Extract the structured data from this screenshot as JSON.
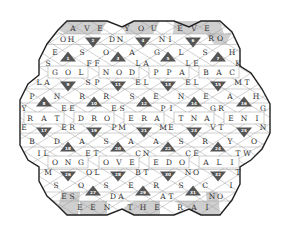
{
  "puzzle": {
    "type": "hexagonal-word-puzzle",
    "colors": {
      "background": "#ffffff",
      "outline": "#222222",
      "grid_line": "#9a9a9a",
      "dark_triangle": "#555555",
      "shaded_border": "#cfcfcf",
      "letter": "#333333",
      "number": "#ffffff"
    },
    "border_phrases": {
      "top": [
        "AVE",
        "YOU",
        "EVE"
      ],
      "bottom": [
        "EEN",
        "THE",
        "RAI"
      ]
    },
    "letters": [
      {
        "t": "A",
        "x": 73,
        "y": 28,
        "shade": true
      },
      {
        "t": "V",
        "x": 87,
        "y": 28,
        "shade": true
      },
      {
        "t": "E",
        "x": 100,
        "y": 28,
        "shade": true
      },
      {
        "t": "Y",
        "x": 127,
        "y": 28,
        "shade": true
      },
      {
        "t": "O",
        "x": 141,
        "y": 28,
        "shade": true
      },
      {
        "t": "U",
        "x": 154,
        "y": 28,
        "shade": true
      },
      {
        "t": "E",
        "x": 180,
        "y": 28,
        "shade": true
      },
      {
        "t": "V",
        "x": 194,
        "y": 28,
        "shade": true
      },
      {
        "t": "E",
        "x": 207,
        "y": 28,
        "shade": true
      },
      {
        "t": "O",
        "x": 63,
        "y": 39
      },
      {
        "t": "H",
        "x": 71,
        "y": 39
      },
      {
        "t": "D",
        "x": 112,
        "y": 39
      },
      {
        "t": "N",
        "x": 120,
        "y": 39
      },
      {
        "t": "N",
        "x": 162,
        "y": 39
      },
      {
        "t": "I",
        "x": 170,
        "y": 39
      },
      {
        "t": "R",
        "x": 211,
        "y": 38
      },
      {
        "t": "O",
        "x": 220,
        "y": 38
      },
      {
        "t": "E",
        "x": 55,
        "y": 52
      },
      {
        "t": "S",
        "x": 82,
        "y": 52
      },
      {
        "t": "O",
        "x": 106,
        "y": 52
      },
      {
        "t": "A",
        "x": 132,
        "y": 52
      },
      {
        "t": "G",
        "x": 157,
        "y": 52
      },
      {
        "t": "L",
        "x": 181,
        "y": 52
      },
      {
        "t": "S",
        "x": 205,
        "y": 52
      },
      {
        "t": "H",
        "x": 232,
        "y": 52
      },
      {
        "t": "S",
        "x": 48,
        "y": 63
      },
      {
        "t": "F",
        "x": 89,
        "y": 63
      },
      {
        "t": "F",
        "x": 97,
        "y": 63
      },
      {
        "t": "L",
        "x": 138,
        "y": 63
      },
      {
        "t": "A",
        "x": 146,
        "y": 63
      },
      {
        "t": "L",
        "x": 188,
        "y": 63
      },
      {
        "t": "E",
        "x": 196,
        "y": 63
      },
      {
        "t": "K",
        "x": 238,
        "y": 63
      },
      {
        "t": "G",
        "x": 55,
        "y": 72
      },
      {
        "t": "O",
        "x": 68,
        "y": 72
      },
      {
        "t": "L",
        "x": 81,
        "y": 72
      },
      {
        "t": "N",
        "x": 106,
        "y": 72
      },
      {
        "t": "O",
        "x": 119,
        "y": 72
      },
      {
        "t": "D",
        "x": 132,
        "y": 72
      },
      {
        "t": "P",
        "x": 156,
        "y": 72
      },
      {
        "t": "P",
        "x": 169,
        "y": 72
      },
      {
        "t": "A",
        "x": 182,
        "y": 72
      },
      {
        "t": "B",
        "x": 206,
        "y": 72
      },
      {
        "t": "A",
        "x": 219,
        "y": 72
      },
      {
        "t": "C",
        "x": 232,
        "y": 72
      },
      {
        "t": "L",
        "x": 39,
        "y": 82
      },
      {
        "t": "A",
        "x": 47,
        "y": 82
      },
      {
        "t": "S",
        "x": 88,
        "y": 82
      },
      {
        "t": "P",
        "x": 97,
        "y": 82
      },
      {
        "t": "E",
        "x": 138,
        "y": 82
      },
      {
        "t": "L",
        "x": 146,
        "y": 82
      },
      {
        "t": "E",
        "x": 188,
        "y": 82
      },
      {
        "t": "L",
        "x": 196,
        "y": 82
      },
      {
        "t": "M",
        "x": 238,
        "y": 82
      },
      {
        "t": "T",
        "x": 247,
        "y": 82
      },
      {
        "t": "P",
        "x": 32,
        "y": 96
      },
      {
        "t": "N",
        "x": 57,
        "y": 96
      },
      {
        "t": "R",
        "x": 82,
        "y": 96
      },
      {
        "t": "R",
        "x": 106,
        "y": 96
      },
      {
        "t": "S",
        "x": 132,
        "y": 96
      },
      {
        "t": "E",
        "x": 156,
        "y": 96
      },
      {
        "t": "N",
        "x": 181,
        "y": 96
      },
      {
        "t": "E",
        "x": 206,
        "y": 96
      },
      {
        "t": "A",
        "x": 230,
        "y": 96
      },
      {
        "t": "H",
        "x": 256,
        "y": 96
      },
      {
        "t": "Y",
        "x": 24,
        "y": 108
      },
      {
        "t": "E",
        "x": 64,
        "y": 108
      },
      {
        "t": "E",
        "x": 72,
        "y": 108
      },
      {
        "t": "E",
        "x": 114,
        "y": 108
      },
      {
        "t": "S",
        "x": 122,
        "y": 108
      },
      {
        "t": "P",
        "x": 163,
        "y": 108
      },
      {
        "t": "I",
        "x": 171,
        "y": 108
      },
      {
        "t": "G",
        "x": 213,
        "y": 108
      },
      {
        "t": "R",
        "x": 221,
        "y": 108
      },
      {
        "t": "G",
        "x": 263,
        "y": 108
      },
      {
        "t": "R",
        "x": 30,
        "y": 118
      },
      {
        "t": "A",
        "x": 44,
        "y": 118
      },
      {
        "t": "T",
        "x": 57,
        "y": 118
      },
      {
        "t": "D",
        "x": 81,
        "y": 118
      },
      {
        "t": "R",
        "x": 94,
        "y": 118
      },
      {
        "t": "O",
        "x": 107,
        "y": 118
      },
      {
        "t": "E",
        "x": 131,
        "y": 118
      },
      {
        "t": "R",
        "x": 144,
        "y": 118
      },
      {
        "t": "A",
        "x": 157,
        "y": 118
      },
      {
        "t": "T",
        "x": 181,
        "y": 118
      },
      {
        "t": "N",
        "x": 194,
        "y": 118
      },
      {
        "t": "A",
        "x": 207,
        "y": 118
      },
      {
        "t": "E",
        "x": 231,
        "y": 118
      },
      {
        "t": "N",
        "x": 244,
        "y": 118
      },
      {
        "t": "I",
        "x": 257,
        "y": 118
      },
      {
        "t": "E",
        "x": 24,
        "y": 127
      },
      {
        "t": "E",
        "x": 64,
        "y": 127
      },
      {
        "t": "R",
        "x": 72,
        "y": 127
      },
      {
        "t": "P",
        "x": 114,
        "y": 127
      },
      {
        "t": "M",
        "x": 122,
        "y": 127
      },
      {
        "t": "M",
        "x": 163,
        "y": 127
      },
      {
        "t": "E",
        "x": 171,
        "y": 127
      },
      {
        "t": "V",
        "x": 213,
        "y": 127
      },
      {
        "t": "T",
        "x": 221,
        "y": 127
      },
      {
        "t": "N",
        "x": 263,
        "y": 127
      },
      {
        "t": "B",
        "x": 32,
        "y": 141
      },
      {
        "t": "D",
        "x": 57,
        "y": 141
      },
      {
        "t": "A",
        "x": 82,
        "y": 141
      },
      {
        "t": "S",
        "x": 106,
        "y": 141
      },
      {
        "t": "A",
        "x": 131,
        "y": 141
      },
      {
        "t": "A",
        "x": 156,
        "y": 141
      },
      {
        "t": "S",
        "x": 181,
        "y": 141
      },
      {
        "t": "R",
        "x": 205,
        "y": 141
      },
      {
        "t": "Y",
        "x": 230,
        "y": 141
      },
      {
        "t": "O",
        "x": 254,
        "y": 141
      },
      {
        "t": "I",
        "x": 39,
        "y": 153
      },
      {
        "t": "L",
        "x": 46,
        "y": 153
      },
      {
        "t": "E",
        "x": 88,
        "y": 153
      },
      {
        "t": "T",
        "x": 96,
        "y": 153
      },
      {
        "t": "C",
        "x": 138,
        "y": 153
      },
      {
        "t": "N",
        "x": 146,
        "y": 153
      },
      {
        "t": "C",
        "x": 188,
        "y": 153
      },
      {
        "t": "E",
        "x": 196,
        "y": 153
      },
      {
        "t": "T",
        "x": 238,
        "y": 153
      },
      {
        "t": "W",
        "x": 247,
        "y": 153
      },
      {
        "t": "O",
        "x": 55,
        "y": 162
      },
      {
        "t": "N",
        "x": 68,
        "y": 162
      },
      {
        "t": "G",
        "x": 81,
        "y": 162
      },
      {
        "t": "O",
        "x": 106,
        "y": 162
      },
      {
        "t": "V",
        "x": 119,
        "y": 162
      },
      {
        "t": "E",
        "x": 132,
        "y": 162
      },
      {
        "t": "E",
        "x": 156,
        "y": 162
      },
      {
        "t": "D",
        "x": 169,
        "y": 162
      },
      {
        "t": "O",
        "x": 182,
        "y": 162
      },
      {
        "t": "A",
        "x": 206,
        "y": 162
      },
      {
        "t": "L",
        "x": 219,
        "y": 162
      },
      {
        "t": "I",
        "x": 232,
        "y": 162
      },
      {
        "t": "M",
        "x": 48,
        "y": 172
      },
      {
        "t": "O",
        "x": 89,
        "y": 172
      },
      {
        "t": "L",
        "x": 97,
        "y": 172
      },
      {
        "t": "B",
        "x": 138,
        "y": 172
      },
      {
        "t": "T",
        "x": 146,
        "y": 172
      },
      {
        "t": "N",
        "x": 188,
        "y": 172
      },
      {
        "t": "O",
        "x": 196,
        "y": 172
      },
      {
        "t": "T",
        "x": 238,
        "y": 172
      },
      {
        "t": "S",
        "x": 56,
        "y": 185
      },
      {
        "t": "O",
        "x": 81,
        "y": 185
      },
      {
        "t": "S",
        "x": 106,
        "y": 185
      },
      {
        "t": "E",
        "x": 131,
        "y": 185
      },
      {
        "t": "R",
        "x": 156,
        "y": 185
      },
      {
        "t": "S",
        "x": 181,
        "y": 185
      },
      {
        "t": "C",
        "x": 205,
        "y": 185
      },
      {
        "t": "I",
        "x": 231,
        "y": 185
      },
      {
        "t": "E",
        "x": 64,
        "y": 196
      },
      {
        "t": "S",
        "x": 72,
        "y": 196,
        "shade": true
      },
      {
        "t": "D",
        "x": 113,
        "y": 196
      },
      {
        "t": "A",
        "x": 121,
        "y": 196
      },
      {
        "t": "A",
        "x": 163,
        "y": 196
      },
      {
        "t": "T",
        "x": 171,
        "y": 196
      },
      {
        "t": "N",
        "x": 212,
        "y": 196,
        "shade": true
      },
      {
        "t": "O",
        "x": 220,
        "y": 196
      },
      {
        "t": "E",
        "x": 80,
        "y": 207,
        "shade": true
      },
      {
        "t": "E",
        "x": 93,
        "y": 207,
        "shade": true
      },
      {
        "t": "N",
        "x": 107,
        "y": 207,
        "shade": true
      },
      {
        "t": "T",
        "x": 130,
        "y": 207,
        "shade": true
      },
      {
        "t": "H",
        "x": 143,
        "y": 207,
        "shade": true
      },
      {
        "t": "E",
        "x": 157,
        "y": 207,
        "shade": true
      },
      {
        "t": "R",
        "x": 180,
        "y": 207,
        "shade": true
      },
      {
        "t": "A",
        "x": 194,
        "y": 207,
        "shade": true
      },
      {
        "t": "I",
        "x": 207,
        "y": 207,
        "shade": true
      }
    ],
    "numbered_triangles": [
      {
        "n": "1",
        "x": 68,
        "y": 57,
        "dir": "up"
      },
      {
        "n": "2",
        "x": 93,
        "y": 42,
        "dir": "down"
      },
      {
        "n": "3",
        "x": 118,
        "y": 57,
        "dir": "up"
      },
      {
        "n": "4",
        "x": 143,
        "y": 42,
        "dir": "down"
      },
      {
        "n": "5",
        "x": 168,
        "y": 57,
        "dir": "up"
      },
      {
        "n": "6",
        "x": 193,
        "y": 42,
        "dir": "down"
      },
      {
        "n": "7",
        "x": 218,
        "y": 57,
        "dir": "up"
      },
      {
        "n": "8",
        "x": 44,
        "y": 102,
        "dir": "up"
      },
      {
        "n": "9",
        "x": 68,
        "y": 86,
        "dir": "down"
      },
      {
        "n": "10",
        "x": 94,
        "y": 102,
        "dir": "up"
      },
      {
        "n": "11",
        "x": 118,
        "y": 86,
        "dir": "down"
      },
      {
        "n": "12",
        "x": 144,
        "y": 102,
        "dir": "up"
      },
      {
        "n": "13",
        "x": 168,
        "y": 86,
        "dir": "down"
      },
      {
        "n": "14",
        "x": 194,
        "y": 102,
        "dir": "up"
      },
      {
        "n": "15",
        "x": 218,
        "y": 86,
        "dir": "down"
      },
      {
        "n": "16",
        "x": 244,
        "y": 102,
        "dir": "up"
      },
      {
        "n": "17",
        "x": 44,
        "y": 132,
        "dir": "down"
      },
      {
        "n": "18",
        "x": 68,
        "y": 147,
        "dir": "up"
      },
      {
        "n": "19",
        "x": 94,
        "y": 132,
        "dir": "down"
      },
      {
        "n": "20",
        "x": 118,
        "y": 147,
        "dir": "up"
      },
      {
        "n": "21",
        "x": 144,
        "y": 132,
        "dir": "down"
      },
      {
        "n": "22",
        "x": 168,
        "y": 147,
        "dir": "up"
      },
      {
        "n": "23",
        "x": 194,
        "y": 132,
        "dir": "down"
      },
      {
        "n": "24",
        "x": 218,
        "y": 147,
        "dir": "up"
      },
      {
        "n": "25",
        "x": 244,
        "y": 132,
        "dir": "down"
      },
      {
        "n": "26",
        "x": 68,
        "y": 176,
        "dir": "down"
      },
      {
        "n": "27",
        "x": 93,
        "y": 191,
        "dir": "up"
      },
      {
        "n": "28",
        "x": 118,
        "y": 176,
        "dir": "down"
      },
      {
        "n": "29",
        "x": 143,
        "y": 191,
        "dir": "up"
      },
      {
        "n": "30",
        "x": 168,
        "y": 176,
        "dir": "down"
      },
      {
        "n": "31",
        "x": 193,
        "y": 191,
        "dir": "up"
      },
      {
        "n": "32",
        "x": 218,
        "y": 176,
        "dir": "down"
      }
    ],
    "squares": [
      {
        "x": 68,
        "y": 72
      },
      {
        "x": 119,
        "y": 72
      },
      {
        "x": 169,
        "y": 72
      },
      {
        "x": 219,
        "y": 72
      },
      {
        "x": 44,
        "y": 118
      },
      {
        "x": 94,
        "y": 118
      },
      {
        "x": 144,
        "y": 118
      },
      {
        "x": 194,
        "y": 118
      },
      {
        "x": 244,
        "y": 118
      },
      {
        "x": 68,
        "y": 162
      },
      {
        "x": 119,
        "y": 162
      },
      {
        "x": 169,
        "y": 162
      },
      {
        "x": 219,
        "y": 162
      }
    ],
    "outline": "67,21 107,21 122,27 134,21 174,21 189,27 201,21 220,21 232,32 240,49 240,66 251,73 262,89 270,104 270,133 262,149 251,160 240,167 240,184 232,200 220,215 201,215 189,209 174,215 134,215 122,209 107,215 67,215 58,206 47,196 39,181 39,167 28,160 20,145 20,100 28,84 39,75 39,60 47,44 58,30",
    "shaded_regions": [
      "67,21 107,21 100,34 66,34 58,30",
      "122,27 134,21 160,21 153,34 126,34",
      "174,21 201,21 220,21 224,34 173,34",
      "206,34 224,34 232,32 226,44 214,44",
      "58,206 62,192 80,192 78,215 67,215",
      "80,201 107,201 107,215 80,215",
      "122,209 134,201 160,201 160,215 134,215",
      "174,201 213,201 220,215 201,215 189,209",
      "206,192 218,192 220,215 208,215"
    ]
  }
}
